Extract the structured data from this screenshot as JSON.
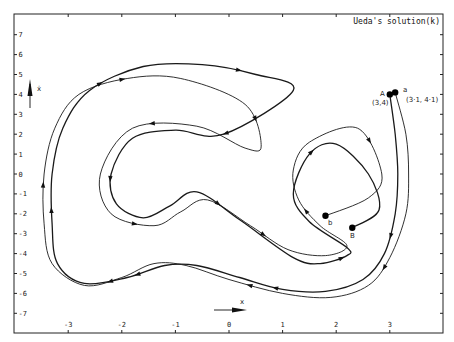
{
  "chart_data": {
    "type": "line",
    "title": "Ueda's solution(k)",
    "xlabel": "x",
    "ylabel": "ẋ",
    "xlim": [
      -3.7,
      4.3
    ],
    "ylim": [
      -8,
      8
    ],
    "grid": false,
    "x_ticks": [
      -3,
      -2,
      -1,
      0,
      1,
      2,
      3
    ],
    "x_tick_labels": [
      "-3",
      "-2",
      "-1",
      "0",
      "1",
      "2",
      "3"
    ],
    "y_ticks": [
      7,
      6,
      5,
      4,
      3,
      2,
      1,
      0,
      -1,
      -2,
      -3,
      -4,
      -5,
      -6,
      -7
    ],
    "y_tick_labels": [
      "7",
      "6",
      "5",
      "4",
      "3",
      "2",
      "1",
      "0",
      "-1",
      "-2",
      "-3",
      "-4",
      "-5",
      "-6",
      "-7"
    ],
    "series": [
      {
        "name": "Trajectory from A (3,4)",
        "start_label": "A",
        "start_coords_label": "(3,4)",
        "start": [
          3.0,
          4.0
        ],
        "end_label": "B",
        "end": [
          2.3,
          -2.7
        ],
        "stroke_width": 1.3,
        "points": [
          [
            3.0,
            4.0
          ],
          [
            3.1,
            2.0
          ],
          [
            3.15,
            0
          ],
          [
            3.1,
            -2
          ],
          [
            2.9,
            -4
          ],
          [
            2.5,
            -5.3
          ],
          [
            1.8,
            -5.9
          ],
          [
            1.0,
            -5.8
          ],
          [
            0.2,
            -5.2
          ],
          [
            -0.6,
            -4.6
          ],
          [
            -1.2,
            -4.6
          ],
          [
            -1.9,
            -5.2
          ],
          [
            -2.7,
            -5.5
          ],
          [
            -3.2,
            -4.5
          ],
          [
            -3.3,
            -2.5
          ],
          [
            -3.3,
            0
          ],
          [
            -3.1,
            2.3
          ],
          [
            -2.6,
            4.2
          ],
          [
            -1.6,
            5.4
          ],
          [
            -0.5,
            5.5
          ],
          [
            0.5,
            5.0
          ],
          [
            1.2,
            4.2
          ],
          [
            -0.1,
            2.0
          ],
          [
            -1.0,
            2.2
          ],
          [
            -1.8,
            1.8
          ],
          [
            -2.2,
            0
          ],
          [
            -2.1,
            -1.5
          ],
          [
            -1.6,
            -2.2
          ],
          [
            -1.1,
            -1.6
          ],
          [
            -0.6,
            -0.9
          ],
          [
            0.2,
            -2.3
          ],
          [
            1.2,
            -4.2
          ],
          [
            1.7,
            -4.5
          ],
          [
            2.2,
            -4.1
          ],
          [
            2.2,
            -3.7
          ],
          [
            1.5,
            -2.4
          ],
          [
            1.2,
            -1.0
          ],
          [
            1.5,
            1.0
          ],
          [
            2.0,
            1.5
          ],
          [
            2.6,
            0.0
          ],
          [
            2.8,
            -1.8
          ],
          [
            2.3,
            -2.7
          ]
        ]
      },
      {
        "name": "Trajectory from a (3.1,4.1)",
        "start_label": "a",
        "start_coords_label": "(3·1, 4·1)",
        "start": [
          3.1,
          4.1
        ],
        "end_label": "b",
        "end": [
          1.8,
          -2.1
        ],
        "stroke_width": 0.9,
        "points": [
          [
            3.1,
            4.1
          ],
          [
            3.3,
            2.0
          ],
          [
            3.35,
            0
          ],
          [
            3.3,
            -2
          ],
          [
            3.0,
            -4.2
          ],
          [
            2.6,
            -5.6
          ],
          [
            1.9,
            -6.2
          ],
          [
            1.0,
            -6.0
          ],
          [
            0.0,
            -5.3
          ],
          [
            -0.8,
            -4.6
          ],
          [
            -1.4,
            -4.5
          ],
          [
            -2.0,
            -5.2
          ],
          [
            -2.7,
            -5.6
          ],
          [
            -3.3,
            -4.5
          ],
          [
            -3.45,
            -2.5
          ],
          [
            -3.45,
            0
          ],
          [
            -3.25,
            2.3
          ],
          [
            -2.8,
            4.0
          ],
          [
            -1.9,
            4.8
          ],
          [
            -0.9,
            4.8
          ],
          [
            0.3,
            3.5
          ],
          [
            0.6,
            1.4
          ],
          [
            0.3,
            1.3
          ],
          [
            -0.6,
            2.4
          ],
          [
            -1.8,
            2.3
          ],
          [
            -2.4,
            0
          ],
          [
            -2.2,
            -2.0
          ],
          [
            -1.4,
            -2.6
          ],
          [
            -0.9,
            -1.9
          ],
          [
            -0.4,
            -1.3
          ],
          [
            0.4,
            -2.6
          ],
          [
            1.1,
            -3.8
          ],
          [
            1.8,
            -4.1
          ],
          [
            2.2,
            -3.6
          ],
          [
            1.7,
            -2.6
          ],
          [
            1.3,
            -1.3
          ],
          [
            1.2,
            0.2
          ],
          [
            1.5,
            1.6
          ],
          [
            2.4,
            2.3
          ],
          [
            2.85,
            0
          ],
          [
            2.6,
            -1.2
          ],
          [
            1.8,
            -2.1
          ]
        ]
      }
    ],
    "annotations": [
      {
        "text": "A",
        "x": 2.9,
        "y": 4.2
      },
      {
        "text": "(3,4)",
        "x": 2.85,
        "y": 3.5
      },
      {
        "text": "a",
        "x": 3.25,
        "y": 4.35
      },
      {
        "text": "(3·1, 4·1)",
        "x": 3.4,
        "y": 3.6
      },
      {
        "text": "b",
        "x": 1.85,
        "y": -2.55
      },
      {
        "text": "B",
        "x": 2.3,
        "y": -3.3
      }
    ],
    "legend": "none"
  },
  "title": "Ueda's solution(k)",
  "axis_arrows": {
    "x_label": "x",
    "y_label": "ẋ"
  },
  "labels": {
    "A": "A",
    "A_coords": "(3,4)",
    "a": "a",
    "a_coords": "(3·1, 4·1)",
    "b": "b",
    "B": "B"
  }
}
